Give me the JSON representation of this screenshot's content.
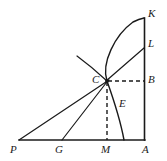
{
  "figure": {
    "type": "geometry-diagram",
    "width": 167,
    "height": 161,
    "background_color": "#ffffff",
    "stroke_color": "#1a1a1a",
    "labels": [
      {
        "id": "K",
        "text": "K",
        "x": 148,
        "y": 8
      },
      {
        "id": "L",
        "text": "L",
        "x": 148,
        "y": 38
      },
      {
        "id": "B",
        "text": "B",
        "x": 148,
        "y": 74
      },
      {
        "id": "C",
        "text": "C",
        "x": 92,
        "y": 74
      },
      {
        "id": "E",
        "text": "E",
        "x": 119,
        "y": 98
      },
      {
        "id": "P",
        "text": "P",
        "x": 10,
        "y": 144
      },
      {
        "id": "G",
        "text": "G",
        "x": 55,
        "y": 144
      },
      {
        "id": "M",
        "text": "M",
        "x": 101,
        "y": 144
      },
      {
        "id": "A",
        "text": "A",
        "x": 142,
        "y": 144
      }
    ],
    "points": {
      "A": {
        "x": 144,
        "y": 140
      },
      "K": {
        "x": 144,
        "y": 18
      },
      "L": {
        "x": 144,
        "y": 48
      },
      "B": {
        "x": 144,
        "y": 81
      },
      "C": {
        "x": 107,
        "y": 81
      },
      "M": {
        "x": 107,
        "y": 140
      },
      "G": {
        "x": 62,
        "y": 140
      },
      "P": {
        "x": 19,
        "y": 140
      },
      "E_curve_foot": {
        "x": 124,
        "y": 140
      },
      "tail_end": {
        "x": 77,
        "y": 56
      }
    },
    "segments": [
      {
        "name": "baseline-PA",
        "from": "P",
        "to": "A",
        "style": "solid"
      },
      {
        "name": "vertical-AK",
        "from": "A",
        "to": "K",
        "style": "solid"
      },
      {
        "name": "line-PC-to-K-region",
        "from": "P",
        "to": "C",
        "style": "solid"
      },
      {
        "name": "line-GC",
        "from": "G",
        "to": "C",
        "style": "solid"
      },
      {
        "name": "line-CL",
        "from": "C",
        "to": "L",
        "style": "solid"
      },
      {
        "name": "tail-through-C",
        "from": "tail_end",
        "to": "C",
        "style": "solid"
      },
      {
        "name": "dashed-CB",
        "from": "C",
        "to": "B",
        "style": "dashed"
      },
      {
        "name": "dashed-CM",
        "from": "C",
        "to": "M",
        "style": "dashed"
      }
    ],
    "curves": [
      {
        "name": "curve-E-through-C-to-K",
        "style": "solid",
        "description": "concave arc from foot E on baseline rising through C up to K"
      }
    ]
  }
}
